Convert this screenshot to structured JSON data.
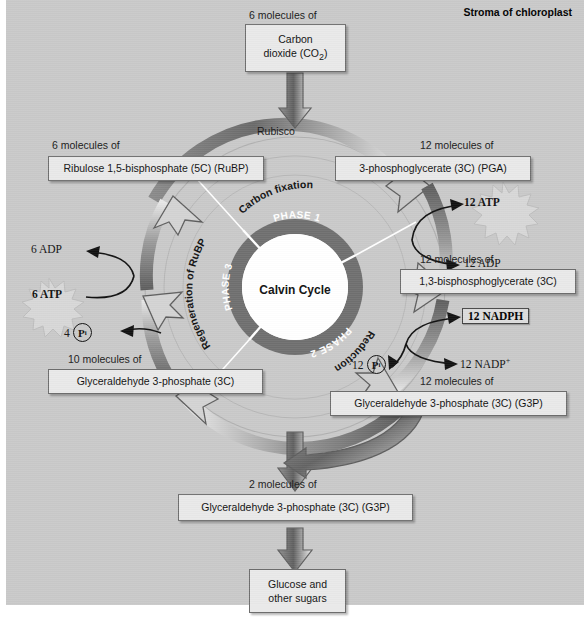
{
  "header": {
    "stroma_label": "Stroma of chloroplast"
  },
  "center": {
    "cycle_label": "Calvin Cycle"
  },
  "ring": {
    "phase1": "PHASE 1",
    "phase2": "PHASE 2",
    "phase3": "PHASE 3"
  },
  "arc_labels": {
    "carbon_fixation": "Carbon fixation",
    "reduction": "Reduction",
    "regeneration": "Regeneration of RuBP",
    "rubisco": "Rubisco"
  },
  "boxes": {
    "co2": {
      "caption": "6 molecules of",
      "line1": "Carbon",
      "line2": "dioxide (CO",
      "sub": "2",
      "line2b": ")"
    },
    "rubp": {
      "caption": "6 molecules of",
      "text": "Ribulose 1,5-bisphosphate (5C) (RuBP)"
    },
    "pga": {
      "caption": "12 molecules of",
      "text": "3-phosphoglycerate (3C) (PGA)"
    },
    "bpg": {
      "caption": "12 molecules of",
      "text": "1,3-bisphosphoglycerate (3C)"
    },
    "g3p_right": {
      "caption": "12 molecules of",
      "text": "Glyceraldehyde 3-phosphate (3C) (G3P)"
    },
    "g3p_left": {
      "caption": "10 molecules of",
      "text": "Glyceraldehyde 3-phosphate (3C)"
    },
    "g3p_out": {
      "caption": "2 molecules of",
      "text": "Glyceraldehyde 3-phosphate (3C) (G3P)"
    },
    "glucose": {
      "line1": "Glucose and",
      "line2": "other sugars"
    }
  },
  "energy": {
    "atp12": "12 ATP",
    "adp12": "12 ADP",
    "nadph12": "12 NADPH",
    "nadp12": "12 NADP",
    "nadp_sup": "+",
    "pi12_count": "12",
    "pi_symbol": "P",
    "pi_sub": "i",
    "adp6": "6 ADP",
    "atp6": "6 ATP",
    "pi4_count": "4"
  },
  "colors": {
    "background": "#c9c9c9",
    "ring_dark": "#6f6f6f",
    "ring_inner": "#ffffff",
    "box_fill": "#e9e9e9",
    "box_border": "#6d6d6d",
    "arrow_dark": "#5a5a5a",
    "arrow_light": "#d9d9d9",
    "star_fill": "#d7d7d7",
    "text": "#111111"
  }
}
